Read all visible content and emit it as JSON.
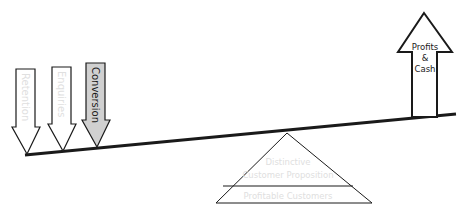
{
  "diagram": {
    "type": "seesaw-balance",
    "colors": {
      "stroke": "#1a1a1a",
      "conversion_fill": "#d0d0d0",
      "faded_text": "#e0e0e0",
      "dark_text": "#1a1a1a",
      "background": "#ffffff"
    },
    "down_arrows": [
      {
        "label": "Retention",
        "style": "faded"
      },
      {
        "label": "Enquiries",
        "style": "faded"
      },
      {
        "label": "Conversion",
        "style": "highlighted"
      }
    ],
    "up_arrow": {
      "lines": [
        "Profits",
        "&",
        "Cash"
      ]
    },
    "fulcrum": {
      "top_lines": [
        "Distinctive",
        "Customer Proposition"
      ],
      "bottom_label": "Profitable Customers"
    }
  }
}
